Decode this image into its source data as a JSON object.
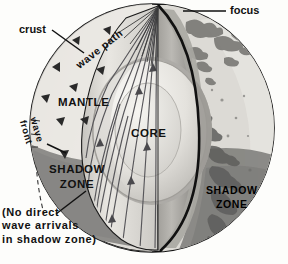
{
  "figure": {
    "type": "diagram"
  },
  "labels": {
    "focus": "focus",
    "crust": "crust",
    "wave_path": "wave path",
    "wave_front": "wave front",
    "wave_front_line1": "wave",
    "wave_front_line2": "front",
    "mantle": "MANTLE",
    "core": "CORE",
    "shadow_zone_left_line1": "SHADOW",
    "shadow_zone_left_line2": "ZONE",
    "shadow_zone_right_line1": "SHADOW",
    "shadow_zone_right_line2": "ZONE",
    "note_line1": "(No direct",
    "note_line2": "wave arrivals",
    "note_line3": "in shadow zone)"
  },
  "colors": {
    "background": "#fdfdfb",
    "globe_surface_light": "#d9d7d2",
    "globe_surface_lit": "#e8e6e1",
    "shadow_zone_dark": "#8d8c8a",
    "shadow_zone_darker": "#6e6d6b",
    "mantle_cut_light": "#efeeea",
    "mantle_cut_mid": "#c9c7c2",
    "core_light": "#f2f1ed",
    "core_mid": "#b9b7b2",
    "core_rim": "#a3a19c",
    "outline": "#111111",
    "ray": "#4a4a4a",
    "grid": "#333333"
  },
  "geometry": {
    "globe_center_x": 152,
    "globe_center_y": 128,
    "globe_radius_x": 122,
    "globe_radius_y": 124,
    "focus_x": 158,
    "focus_y": 6
  }
}
